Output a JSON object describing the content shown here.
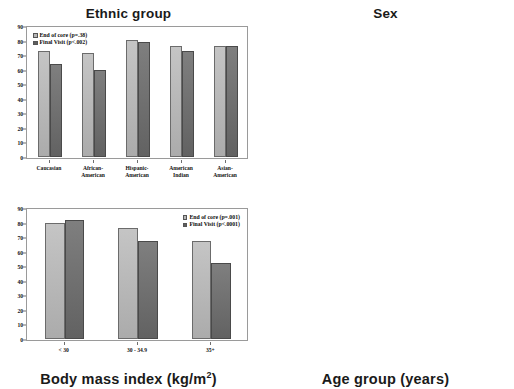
{
  "figure": {
    "title": "",
    "panels": 4
  },
  "chart_data": [
    {
      "id": "ethnic-group",
      "type": "bar",
      "title": "Ethnic group",
      "title_position": "top",
      "xlabel": "",
      "ylabel": "",
      "ylim": [
        0,
        90
      ],
      "yticks": [
        0,
        10,
        20,
        30,
        40,
        50,
        60,
        70,
        80,
        90
      ],
      "grid": false,
      "legend_position": "top-left",
      "categories": [
        "Caucasian",
        "African-\nAmerican",
        "Hispanic-\nAmerican",
        "American\nIndian",
        "Asian-\nAmerican"
      ],
      "series": [
        {
          "name": "End of core (p=.38)",
          "color": "#b6b6b6",
          "values": [
            73,
            71.5,
            80.5,
            76.5,
            76.5
          ]
        },
        {
          "name": "Final Visit (p<.002)",
          "color": "#6d6d6d",
          "values": [
            64,
            60,
            79,
            73,
            76
          ]
        }
      ]
    },
    {
      "id": "sex",
      "type": "bar",
      "title": "Sex",
      "title_position": "top",
      "xlabel": "",
      "ylabel": "",
      "ylim": [
        0,
        90
      ],
      "yticks": [
        0,
        10,
        20,
        30,
        40,
        50,
        60,
        70,
        80,
        90
      ],
      "grid": false,
      "legend_position": "top-right",
      "categories": [
        "Male",
        "Female"
      ],
      "series": [
        {
          "name": "End of core (p=.001)",
          "color": "#b6b6b6",
          "values": [
            83,
            70.5
          ]
        },
        {
          "name": "Final Visit (p<.001)",
          "color": "#6d6d6d",
          "values": [
            76.5,
            63
          ]
        }
      ]
    },
    {
      "id": "body-mass-index",
      "type": "bar",
      "title": "Body mass index (kg/m2)",
      "title_main": "Body mass index (kg/m",
      "title_sup": "2",
      "title_tail": ")",
      "title_position": "bottom",
      "xlabel": "",
      "ylabel": "",
      "ylim": [
        0,
        90
      ],
      "yticks": [
        0,
        10,
        20,
        30,
        40,
        50,
        60,
        70,
        80,
        90
      ],
      "grid": false,
      "legend_position": "top-right",
      "categories": [
        "< 30",
        "30 - 34.9",
        "35+"
      ],
      "series": [
        {
          "name": "End of core (p=.001)",
          "color": "#b6b6b6",
          "values": [
            79.5,
            76.5,
            67.5
          ]
        },
        {
          "name": "Final Visit (p<.0001)",
          "color": "#6d6d6d",
          "values": [
            81.5,
            67.5,
            52
          ]
        }
      ]
    },
    {
      "id": "age-group",
      "type": "bar",
      "title": "Age group (years)",
      "title_position": "bottom",
      "xlabel": "",
      "ylabel": "",
      "ylim": [
        0,
        90
      ],
      "yticks": [
        0,
        10,
        20,
        30,
        40,
        50,
        60,
        70,
        80,
        90
      ],
      "grid": false,
      "legend_position": "top-left",
      "categories": [
        "< 45",
        "45 - 59",
        "60 - 64",
        "65+"
      ],
      "series": [
        {
          "name": "End of core (p=.01)",
          "color": "#b6b6b6",
          "values": [
            68.5,
            74.5,
            81.5,
            82.5
          ]
        },
        {
          "name": "Final Visit (p<.001)",
          "color": "#6d6d6d",
          "values": [
            59,
            66,
            79,
            81
          ]
        }
      ]
    }
  ],
  "colors": {
    "series_light": "#b6b6b6",
    "series_dark": "#6d6d6d",
    "axis": "#9a9a9a",
    "text": "#111111",
    "background": "#ffffff"
  }
}
